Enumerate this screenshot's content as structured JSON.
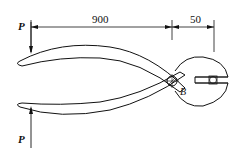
{
  "diagram": {
    "dimensions": [
      {
        "label": "900",
        "between": "force P line and pivot B"
      },
      {
        "label": "50",
        "between": "pivot B and jaw object"
      }
    ],
    "forces": [
      {
        "label": "P",
        "position": "top handle",
        "direction": "down"
      },
      {
        "label": "P",
        "position": "bottom handle",
        "direction": "up"
      }
    ],
    "pivot_label": "B"
  }
}
